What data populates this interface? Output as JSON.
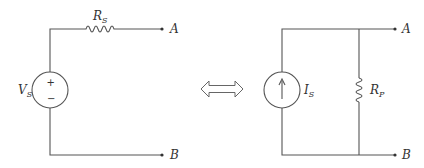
{
  "diagram": {
    "type": "circuit-equivalence",
    "left_circuit": {
      "source": {
        "kind": "voltage-source",
        "label": "V",
        "subscript": "S",
        "plus_sign": "+",
        "minus_sign": "−"
      },
      "resistor": {
        "kind": "series-resistor",
        "label": "R",
        "subscript": "S"
      },
      "terminals": [
        {
          "label": "A"
        },
        {
          "label": "B"
        }
      ]
    },
    "equivalence_symbol": "double-arrow",
    "right_circuit": {
      "source": {
        "kind": "current-source",
        "label": "I",
        "subscript": "S",
        "arrow_direction": "up"
      },
      "resistor": {
        "kind": "parallel-resistor",
        "label": "R",
        "subscript": "P"
      },
      "terminals": [
        {
          "label": "A"
        },
        {
          "label": "B"
        }
      ]
    },
    "colors": {
      "wire": "#555555",
      "text": "#333333",
      "background": "#ffffff"
    }
  }
}
